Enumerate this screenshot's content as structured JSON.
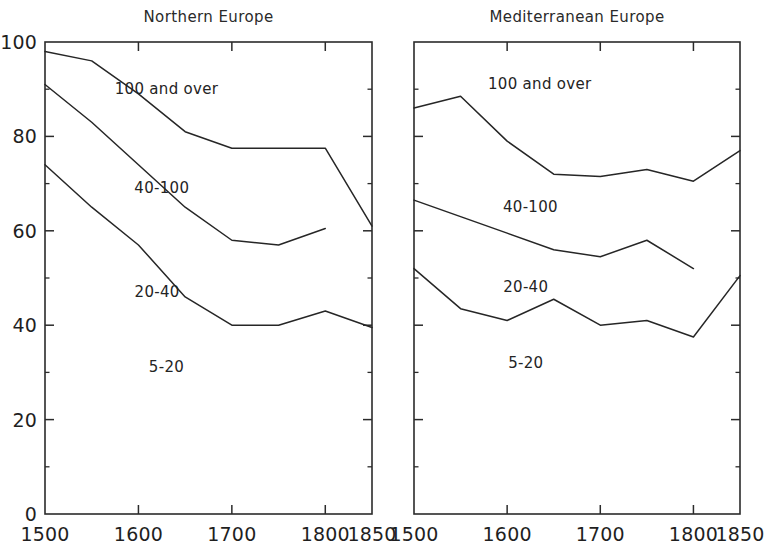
{
  "figure": {
    "background_color": "#ffffff",
    "line_color": "#262626",
    "axis_color": "#2b2b2b"
  },
  "chart_data": [
    {
      "type": "line",
      "title": "Northern Europe",
      "xlabel": "",
      "ylabel": "",
      "xlim": [
        1500,
        1850
      ],
      "ylim": [
        0,
        100
      ],
      "xticks": [
        1500,
        1600,
        1700,
        1800,
        1850
      ],
      "xtick_labels": [
        "1500",
        "1600",
        "1700",
        "1800",
        "1850"
      ],
      "yticks": [
        0,
        20,
        40,
        60,
        80,
        100
      ],
      "ytick_labels": [
        "0",
        "20",
        "40",
        "60",
        "80",
        "100"
      ],
      "grid": false,
      "legend_position": "in-plot-annotations",
      "annotations": [
        {
          "text": "100 and over",
          "x": 1630,
          "y": 89
        },
        {
          "text": "40-100",
          "x": 1625,
          "y": 68
        },
        {
          "text": "20-40",
          "x": 1620,
          "y": 46
        },
        {
          "text": "5-20",
          "x": 1630,
          "y": 30
        }
      ],
      "series": [
        {
          "name": "100 and over (lower boundary)",
          "x": [
            1500,
            1550,
            1600,
            1650,
            1700,
            1750,
            1800,
            1850
          ],
          "values": [
            98,
            96,
            89,
            81,
            77.5,
            77.5,
            77.5,
            61
          ]
        },
        {
          "name": "40-100 (lower boundary)",
          "x": [
            1500,
            1550,
            1600,
            1650,
            1700,
            1750,
            1800
          ],
          "values": [
            91,
            83,
            74,
            65,
            58,
            57,
            60.5
          ]
        },
        {
          "name": "20-40 (lower boundary)",
          "x": [
            1500,
            1550,
            1600,
            1650,
            1700,
            1750,
            1800,
            1850
          ],
          "values": [
            74,
            65,
            57,
            46,
            40,
            40,
            43,
            39.5
          ]
        }
      ]
    },
    {
      "type": "line",
      "title": "Mediterranean Europe",
      "xlabel": "",
      "ylabel": "",
      "xlim": [
        1500,
        1850
      ],
      "ylim": [
        0,
        100
      ],
      "xticks": [
        1500,
        1600,
        1700,
        1800,
        1850
      ],
      "xtick_labels": [
        "1500",
        "1600",
        "1700",
        "1800",
        "1850"
      ],
      "yticks": [
        0,
        20,
        40,
        60,
        80,
        100
      ],
      "ytick_labels": [
        "",
        "",
        "",
        "",
        "",
        ""
      ],
      "grid": false,
      "legend_position": "in-plot-annotations",
      "annotations": [
        {
          "text": "100 and over",
          "x": 1635,
          "y": 90
        },
        {
          "text": "40-100",
          "x": 1625,
          "y": 64
        },
        {
          "text": "20-40",
          "x": 1620,
          "y": 47
        },
        {
          "text": "5-20",
          "x": 1620,
          "y": 31
        }
      ],
      "series": [
        {
          "name": "100 and over (lower boundary)",
          "x": [
            1500,
            1550,
            1600,
            1650,
            1700,
            1750,
            1800,
            1850
          ],
          "values": [
            86,
            88.5,
            79,
            72,
            71.5,
            73,
            70.5,
            77
          ]
        },
        {
          "name": "40-100 (lower boundary)",
          "x": [
            1500,
            1550,
            1600,
            1650,
            1700,
            1750,
            1800
          ],
          "values": [
            66.5,
            63,
            59.5,
            56,
            54.5,
            58,
            52
          ]
        },
        {
          "name": "20-40 (lower boundary)",
          "x": [
            1500,
            1550,
            1600,
            1650,
            1700,
            1750,
            1800,
            1850
          ],
          "values": [
            52,
            43.5,
            41,
            45.5,
            40,
            41,
            37.5,
            50.5
          ]
        }
      ]
    }
  ]
}
